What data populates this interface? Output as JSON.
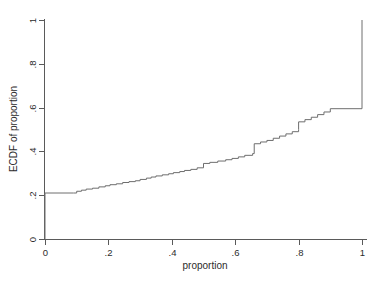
{
  "chart_data": {
    "type": "line",
    "subtype": "step-ecdf",
    "title": "",
    "xlabel": "proportion",
    "ylabel": "ECDF of proportion",
    "xlim": [
      0,
      1
    ],
    "ylim": [
      0,
      1
    ],
    "grid": false,
    "legend": "none",
    "line_color": "#6e6e6e",
    "axis_color": "#5a5a5a",
    "background_color": "#ffffff",
    "xticks": [
      0,
      0.2,
      0.4,
      0.6,
      0.8,
      1
    ],
    "xtick_labels": [
      "0",
      ".2",
      ".4",
      ".6",
      ".8",
      "1"
    ],
    "yticks": [
      0,
      0.2,
      0.4,
      0.6,
      0.8,
      1
    ],
    "ytick_labels": [
      "0",
      ".2",
      ".4",
      ".6",
      ".8",
      "1"
    ],
    "ytick_label_rotation": -90,
    "series": [
      {
        "name": "ECDF of proportion",
        "step": "post",
        "x": [
          0.0,
          0.0,
          0.09,
          0.1,
          0.115,
          0.13,
          0.15,
          0.17,
          0.19,
          0.205,
          0.225,
          0.245,
          0.265,
          0.285,
          0.3,
          0.32,
          0.335,
          0.35,
          0.37,
          0.39,
          0.405,
          0.425,
          0.44,
          0.46,
          0.48,
          0.5,
          0.5,
          0.52,
          0.545,
          0.57,
          0.59,
          0.61,
          0.63,
          0.655,
          0.66,
          0.68,
          0.7,
          0.72,
          0.74,
          0.76,
          0.78,
          0.8,
          0.8,
          0.82,
          0.84,
          0.86,
          0.88,
          0.9,
          1.0,
          1.0
        ],
        "y": [
          0.0,
          0.21,
          0.21,
          0.218,
          0.223,
          0.228,
          0.232,
          0.238,
          0.243,
          0.248,
          0.252,
          0.258,
          0.262,
          0.266,
          0.272,
          0.278,
          0.283,
          0.288,
          0.293,
          0.298,
          0.303,
          0.308,
          0.313,
          0.318,
          0.325,
          0.325,
          0.345,
          0.35,
          0.356,
          0.362,
          0.368,
          0.375,
          0.382,
          0.39,
          0.435,
          0.443,
          0.45,
          0.46,
          0.47,
          0.48,
          0.49,
          0.5,
          0.535,
          0.545,
          0.556,
          0.568,
          0.58,
          0.595,
          0.595,
          1.0
        ]
      }
    ],
    "annotations": {
      "initial_jump": "Vertical rise from 0 to 0.21 at proportion = 0",
      "mid_jump": "Step from 0.325 to 0.345 at proportion = 0.5",
      "large_jump": "Step from 0.39 to 0.435 at proportion = 0.66",
      "final_jump": "Vertical rise from 0.595 to 1 at proportion = 1",
      "plateau": "Flat at 0.595 from proportion 0.9 to 1.0"
    }
  },
  "axes": {
    "x_title": "proportion",
    "y_title": "ECDF of proportion"
  }
}
